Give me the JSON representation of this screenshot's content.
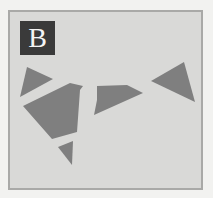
{
  "figure": {
    "panel_label": "B",
    "colors": {
      "background": "#d9d9d7",
      "border": "#a9a9a7",
      "fragment_fill": "#7f7f7f",
      "label_bg": "#3a3a3a",
      "label_text": "#f4f4f4"
    },
    "fragments": [
      {
        "name": "fragment-triangle-left",
        "points": "27,67 53,79 20,97"
      },
      {
        "name": "fragment-large-polygon",
        "points": "23,106 70,83 83,86 80,90 77,132 52,139"
      },
      {
        "name": "fragment-small-triangle-bottom",
        "points": "58,147 73,141 72,165"
      },
      {
        "name": "fragment-middle-quad",
        "points": "97,86 127,85 143,93 94,115 97,100"
      },
      {
        "name": "fragment-triangle-right",
        "points": "151,81 184,62 195,102"
      }
    ]
  }
}
